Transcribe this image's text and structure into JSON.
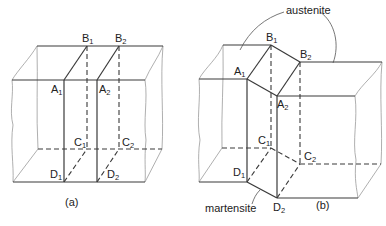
{
  "figure_a": {
    "caption": "(a)",
    "labels": {
      "B1": {
        "main": "B",
        "sub": "1"
      },
      "B2": {
        "main": "B",
        "sub": "2"
      },
      "A1": {
        "main": "A",
        "sub": "1"
      },
      "A2": {
        "main": "A",
        "sub": "2"
      },
      "C1": {
        "main": "C",
        "sub": "1"
      },
      "C2": {
        "main": "C",
        "sub": "2"
      },
      "D1": {
        "main": "D",
        "sub": "1"
      },
      "D2": {
        "main": "D",
        "sub": "2"
      }
    }
  },
  "figure_b": {
    "caption": "(b)",
    "annotations": {
      "austenite": "austenite",
      "martensite": "martensite"
    },
    "labels": {
      "B1": {
        "main": "B",
        "sub": "1"
      },
      "B2": {
        "main": "B",
        "sub": "2"
      },
      "A1": {
        "main": "A",
        "sub": "1"
      },
      "A2": {
        "main": "A",
        "sub": "2"
      },
      "C1": {
        "main": "C",
        "sub": "1"
      },
      "C2": {
        "main": "C",
        "sub": "2"
      },
      "D1": {
        "main": "D",
        "sub": "1"
      },
      "D2": {
        "main": "D",
        "sub": "2"
      }
    }
  }
}
